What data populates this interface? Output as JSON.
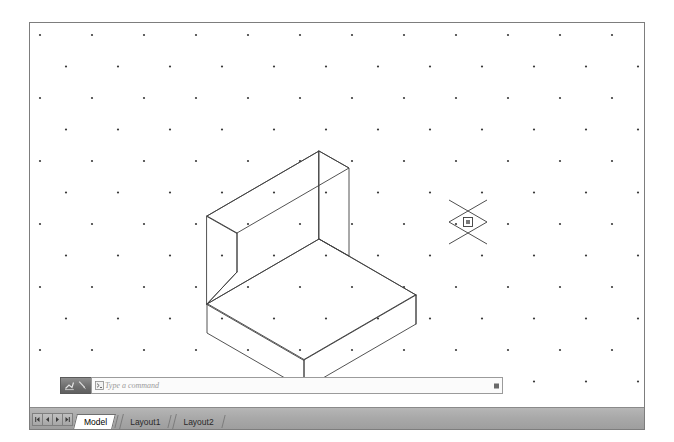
{
  "application": {
    "name": "CAD Drawing Editor",
    "canvas_background": "#ffffff",
    "border_color": "#7d7d7d",
    "status_bar_color": "#a9a9a9"
  },
  "canvas": {
    "grid": {
      "type": "isometric-dot-grid",
      "dot_color": "#3b3b3b",
      "dot_size_px": 2.2,
      "column_spacing_px": 52,
      "row_spacing_px": 31.5,
      "row_offset_px": 26,
      "columns": 12,
      "rows": 13
    },
    "drawing": {
      "name": "isometric-l-shaped-solid",
      "description": "Isometric wireframe of an L-shaped block: a horizontal base slab with a vertical back wall rising from its rear-left edge",
      "line_color": "#404040",
      "line_width_px": 0.9,
      "iso_angle_degrees": 30,
      "vertices": {
        "wall_top_apex": [
          318,
          110
        ],
        "wall_top_right_back": [
          348,
          126
        ],
        "wall_top_left_back": [
          206,
          174
        ],
        "wall_top_left_front": [
          235,
          190
        ],
        "wall_base_left_outer": [
          206,
          226
        ],
        "wall_base_left_inner": [
          235,
          242
        ],
        "wall_front_bottom": [
          318,
          198
        ],
        "wall_right_bottom": [
          348,
          215
        ],
        "base_left_corner": [
          206,
          226
        ],
        "base_front_corner": [
          318,
          291
        ],
        "base_right_corner": [
          415,
          236
        ],
        "base_back_corner": [
          348,
          215
        ],
        "base_front_bottom": [
          318,
          320
        ],
        "base_left_bottom": [
          206,
          255
        ],
        "base_right_bottom": [
          415,
          265
        ]
      }
    },
    "cursor": {
      "name": "isometric-crosshair-cursor",
      "x": 467,
      "y": 210,
      "pickbox_size_px": 9,
      "arm_length_px": 22,
      "color": "#3a3a3a"
    }
  },
  "command_bar": {
    "placeholder": "Type a command",
    "value": "",
    "prompt_icon": "command-prompt-icon",
    "tools": [
      {
        "icon": "pan-tool-icon",
        "label": "Pan"
      },
      {
        "icon": "zoom-tool-icon",
        "label": "Zoom"
      }
    ],
    "dropdown_icon": "dropdown-marker-icon"
  },
  "status_bar": {
    "nav_buttons": [
      {
        "name": "first-layout-button",
        "icon": "first-icon"
      },
      {
        "name": "previous-layout-button",
        "icon": "previous-icon"
      },
      {
        "name": "next-layout-button",
        "icon": "next-icon"
      },
      {
        "name": "last-layout-button",
        "icon": "last-icon"
      }
    ],
    "tabs": [
      {
        "label": "Model",
        "active": true
      },
      {
        "label": "Layout1",
        "active": false
      },
      {
        "label": "Layout2",
        "active": false
      }
    ]
  }
}
